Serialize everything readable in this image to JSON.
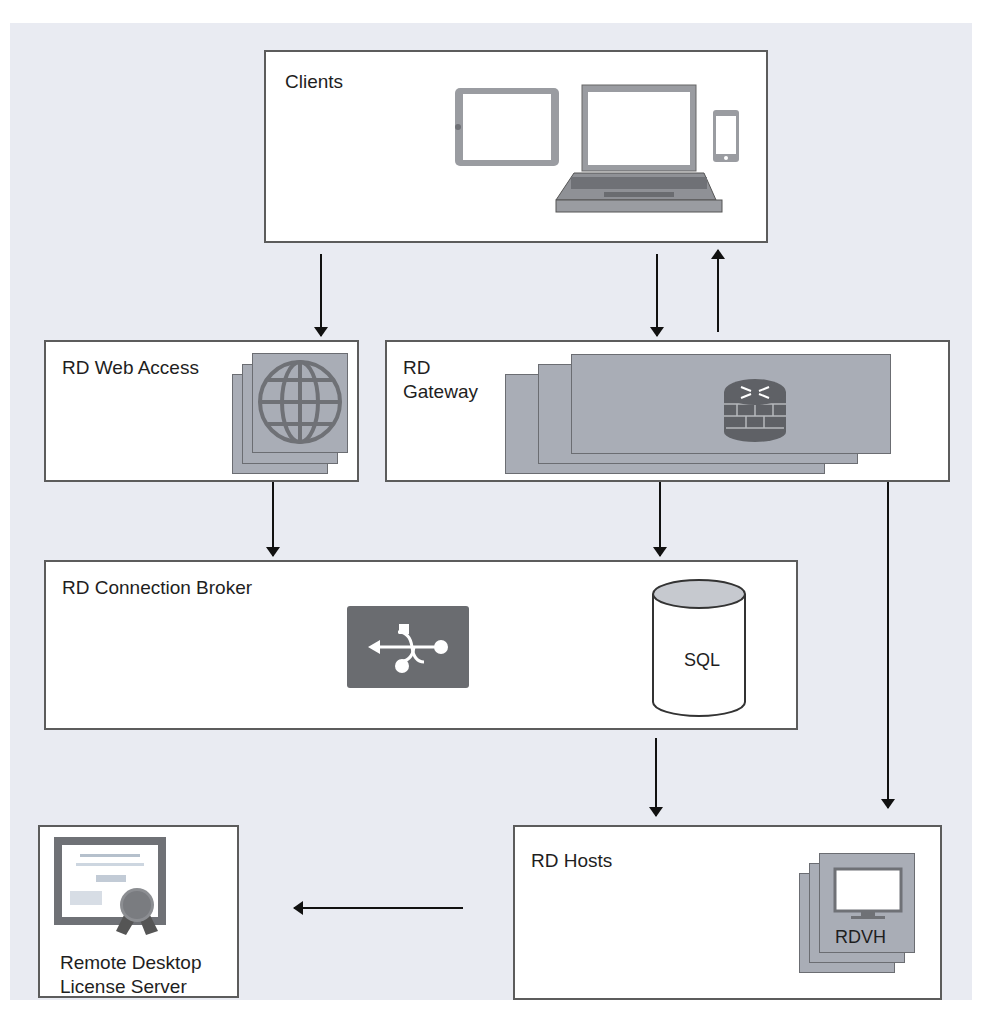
{
  "diagram": {
    "nodes": {
      "clients": {
        "label": "Clients",
        "icons": [
          "tablet-icon",
          "laptop-icon",
          "phone-icon"
        ]
      },
      "web_access": {
        "label": "RD Web Access",
        "icon": "globe-icon"
      },
      "gateway": {
        "label_line1": "RD",
        "label_line2": "Gateway",
        "icon": "router-firewall-icon"
      },
      "broker": {
        "label": "RD Connection Broker",
        "icon": "usb-icon",
        "db_label": "SQL"
      },
      "license": {
        "label_line1": "Remote Desktop",
        "label_line2": "License Server",
        "icon": "certificate-icon"
      },
      "hosts": {
        "label": "RD Hosts",
        "icon_label": "RDVH",
        "icon": "monitor-icon"
      }
    },
    "edges": [
      {
        "from": "Clients",
        "to": "RD Web Access"
      },
      {
        "from": "Clients",
        "to": "RD Gateway"
      },
      {
        "from": "RD Gateway",
        "to": "Clients"
      },
      {
        "from": "RD Web Access",
        "to": "RD Connection Broker"
      },
      {
        "from": "RD Gateway",
        "to": "RD Connection Broker"
      },
      {
        "from": "RD Connection Broker",
        "to": "SQL",
        "bidirectional": true
      },
      {
        "from": "RD Gateway",
        "to": "RD Hosts",
        "bidirectional": true
      },
      {
        "from": "RD Connection Broker",
        "to": "RD Hosts"
      },
      {
        "from": "RD Hosts",
        "to": "Remote Desktop License Server"
      }
    ]
  },
  "colors": {
    "background": "#e9ebf2",
    "box_border": "#5c5c5c",
    "icon_gray": "#8f9196",
    "card_gray": "#a9adb6",
    "arrow": "#111111"
  }
}
